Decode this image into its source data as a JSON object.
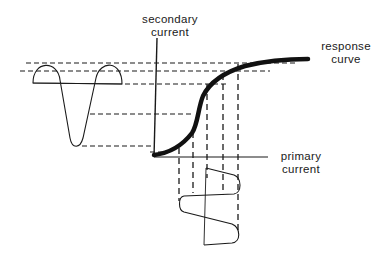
{
  "diagram": {
    "labels": {
      "secondary_line1": "secondary",
      "secondary_line2": "current",
      "response_line1": "response",
      "response_line2": "curve",
      "primary_line1": "primary",
      "primary_line2": "current"
    },
    "colors": {
      "ink": "#1a1a1a",
      "background": "#ffffff"
    },
    "elements": [
      "secondary-current-axis",
      "primary-current-axis",
      "response-curve",
      "secondary-waveform",
      "primary-waveform",
      "horizontal-projection-lines",
      "vertical-projection-lines"
    ]
  }
}
